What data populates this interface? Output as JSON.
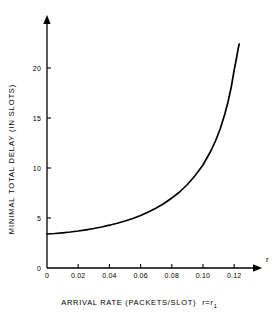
{
  "chart_data": {
    "type": "line",
    "title": "",
    "xlabel": "ARRIVAL RATE (PACKETS/SLOT)",
    "ylabel": "MINIMAL TOTAL DELAY (IN SLOTS)",
    "axis_name_x": "r",
    "caption_main": "ARRIVAL RATE (PACKETS/SLOT)",
    "caption_condition": "r=r",
    "caption_condition_subscript": "1",
    "xlim": [
      0,
      0.1345
    ],
    "ylim": [
      0,
      24
    ],
    "xticks": [
      0,
      0.02,
      0.04,
      0.06,
      0.08,
      0.1,
      0.12
    ],
    "xticklabels": [
      "0",
      "0.02",
      "0.04",
      "0.06",
      "0.08",
      "0.10",
      "0.12"
    ],
    "yticks": [
      0,
      5,
      10,
      15,
      20
    ],
    "yticklabels": [
      "0",
      "5",
      "10",
      "15",
      "20"
    ],
    "grid": false,
    "legend": "none",
    "line_color": "#000000",
    "axis_color": "#000000",
    "x": [
      0.0,
      0.005,
      0.01,
      0.015,
      0.02,
      0.025,
      0.03,
      0.035,
      0.04,
      0.045,
      0.05,
      0.055,
      0.06,
      0.065,
      0.07,
      0.075,
      0.08,
      0.085,
      0.09,
      0.095,
      0.1,
      0.105,
      0.108,
      0.111,
      0.114,
      0.116,
      0.118,
      0.12,
      0.1215,
      0.1225,
      0.1232
    ],
    "y": [
      3.4,
      3.45,
      3.52,
      3.6,
      3.7,
      3.82,
      3.95,
      4.1,
      4.28,
      4.48,
      4.7,
      4.95,
      5.25,
      5.6,
      6.0,
      6.45,
      7.0,
      7.6,
      8.35,
      9.25,
      10.3,
      11.7,
      12.7,
      13.9,
      15.4,
      16.6,
      18.0,
      19.8,
      21.0,
      21.9,
      22.4
    ],
    "series_name": "minimal total delay"
  }
}
